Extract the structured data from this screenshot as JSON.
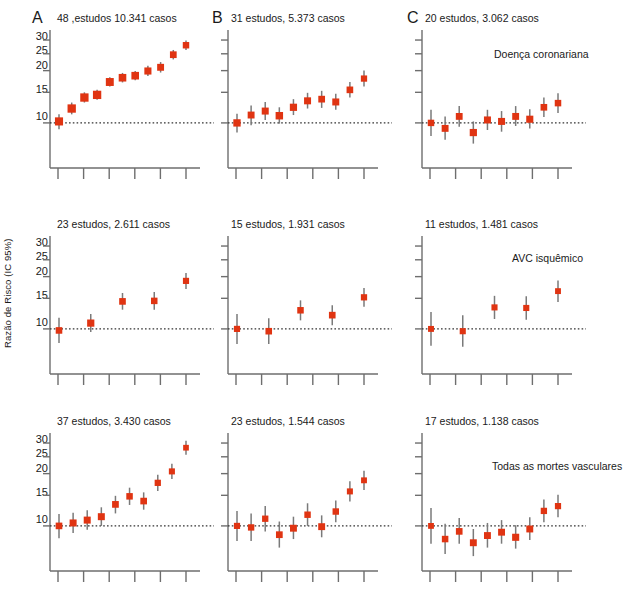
{
  "figure": {
    "axis_label_y": "Razão de Risco (IC 95%)",
    "marker_color": "#E03412",
    "whisker_color": "#7a7a7a",
    "axis_color": "#6e6e6e",
    "ref_line_color": "#333333",
    "ref_line_value": 1.0,
    "background": "#ffffff"
  },
  "panels": {
    "a1": {
      "letter": "A",
      "title": "48 ,estudos 10.341 casos",
      "note": ""
    },
    "b1": {
      "letter": "B",
      "title": "31 estudos, 5.373 casos",
      "note": ""
    },
    "c1": {
      "letter": "C",
      "title": "20 estudos, 3.062 casos",
      "note": "Doença coronariana"
    },
    "a2": {
      "letter": "",
      "title": "23 estudos, 2.611 casos",
      "note": ""
    },
    "b2": {
      "letter": "",
      "title": "15 estudos, 1.931 casos",
      "note": ""
    },
    "c2": {
      "letter": "",
      "title": "11 estudos, 1.481 casos",
      "note": "AVC isquêmico"
    },
    "a3": {
      "letter": "",
      "title": "37 estudos, 3.430 casos",
      "note": ""
    },
    "b3": {
      "letter": "",
      "title": "23 estudos, 1.544 casos",
      "note": ""
    },
    "c3": {
      "letter": "",
      "title": "17 estudos, 1.138 casos",
      "note": "Todas as mortes vasculares"
    }
  },
  "axis": {
    "y_ticks": [
      1.0,
      1.5,
      2.0,
      2.5,
      3.0
    ],
    "y_tick_labels": [
      "10",
      "15",
      "20",
      "25",
      "30"
    ],
    "y_min": 0.68,
    "y_max": 3.25,
    "x_tick_count": 6,
    "x_tick_labels": []
  },
  "chart_data": {
    "type": "scatter",
    "xlabel": "",
    "ylabel": "Razão de Risco (IC 95%)",
    "ylim": [
      0.68,
      3.25
    ],
    "yscale": "log",
    "ytick_values": [
      1.0,
      1.5,
      2.0,
      2.5,
      3.0
    ],
    "ytick_labels": [
      "10",
      "15",
      "20",
      "25",
      "30"
    ],
    "grid": false,
    "legend": "none",
    "reference_line": 1.0,
    "annotations": [
      "Doença coronariana",
      "AVC isquêmico",
      "Todas as mortes vasculares"
    ],
    "series": [
      {
        "name": "a1",
        "panel": "A",
        "row": "Doença coronariana",
        "studies": 48,
        "cases": "10.341",
        "label": "48 ,estudos 10.341 casos",
        "points": [
          {
            "x": 1,
            "y": 1.02,
            "lo": 0.92,
            "hi": 1.12
          },
          {
            "x": 2,
            "y": 1.21,
            "lo": 1.12,
            "hi": 1.31
          },
          {
            "x": 3,
            "y": 1.4,
            "lo": 1.31,
            "hi": 1.5
          },
          {
            "x": 4,
            "y": 1.45,
            "lo": 1.36,
            "hi": 1.55
          },
          {
            "x": 5,
            "y": 1.72,
            "lo": 1.62,
            "hi": 1.83
          },
          {
            "x": 6,
            "y": 1.82,
            "lo": 1.71,
            "hi": 1.94
          },
          {
            "x": 7,
            "y": 1.87,
            "lo": 1.76,
            "hi": 1.99
          },
          {
            "x": 8,
            "y": 1.99,
            "lo": 1.86,
            "hi": 2.13
          },
          {
            "x": 9,
            "y": 2.09,
            "lo": 1.95,
            "hi": 2.24
          },
          {
            "x": 10,
            "y": 2.47,
            "lo": 2.32,
            "hi": 2.63
          },
          {
            "x": 11,
            "y": 2.8,
            "lo": 2.63,
            "hi": 2.98
          }
        ]
      },
      {
        "name": "b1",
        "panel": "B",
        "row": "Doença coronariana",
        "studies": 31,
        "cases": "5.373",
        "label": "31 estudos, 5.373 casos",
        "points": [
          {
            "x": 1,
            "y": 1.0,
            "lo": 0.88,
            "hi": 1.13
          },
          {
            "x": 2,
            "y": 1.11,
            "lo": 0.97,
            "hi": 1.26
          },
          {
            "x": 3,
            "y": 1.17,
            "lo": 1.04,
            "hi": 1.32
          },
          {
            "x": 4,
            "y": 1.1,
            "lo": 0.99,
            "hi": 1.23
          },
          {
            "x": 5,
            "y": 1.23,
            "lo": 1.11,
            "hi": 1.37
          },
          {
            "x": 6,
            "y": 1.34,
            "lo": 1.21,
            "hi": 1.49
          },
          {
            "x": 7,
            "y": 1.37,
            "lo": 1.22,
            "hi": 1.53
          },
          {
            "x": 8,
            "y": 1.32,
            "lo": 1.19,
            "hi": 1.47
          },
          {
            "x": 9,
            "y": 1.55,
            "lo": 1.4,
            "hi": 1.72
          },
          {
            "x": 10,
            "y": 1.8,
            "lo": 1.62,
            "hi": 2.0
          }
        ]
      },
      {
        "name": "c1",
        "panel": "C",
        "row": "Doença coronariana",
        "studies": 20,
        "cases": "3.062",
        "label": "20 estudos, 3.062 casos",
        "points": [
          {
            "x": 1,
            "y": 1.0,
            "lo": 0.84,
            "hi": 1.19
          },
          {
            "x": 2,
            "y": 0.93,
            "lo": 0.8,
            "hi": 1.09
          },
          {
            "x": 3,
            "y": 1.09,
            "lo": 0.95,
            "hi": 1.25
          },
          {
            "x": 4,
            "y": 0.88,
            "lo": 0.76,
            "hi": 1.02
          },
          {
            "x": 5,
            "y": 1.04,
            "lo": 0.91,
            "hi": 1.19
          },
          {
            "x": 6,
            "y": 1.02,
            "lo": 0.89,
            "hi": 1.17
          },
          {
            "x": 7,
            "y": 1.09,
            "lo": 0.96,
            "hi": 1.25
          },
          {
            "x": 8,
            "y": 1.05,
            "lo": 0.93,
            "hi": 1.2
          },
          {
            "x": 9,
            "y": 1.23,
            "lo": 1.08,
            "hi": 1.4
          },
          {
            "x": 10,
            "y": 1.3,
            "lo": 1.14,
            "hi": 1.48
          }
        ]
      },
      {
        "name": "a2",
        "panel": "A",
        "row": "AVC isquêmico",
        "studies": 23,
        "cases": "2.611",
        "label": "23 estudos, 2.611 casos",
        "points": [
          {
            "x": 1,
            "y": 0.98,
            "lo": 0.83,
            "hi": 1.16
          },
          {
            "x": 2,
            "y": 1.08,
            "lo": 0.96,
            "hi": 1.22
          },
          {
            "x": 3,
            "y": 1.44,
            "lo": 1.29,
            "hi": 1.61
          },
          {
            "x": 4,
            "y": 1.45,
            "lo": 1.29,
            "hi": 1.63
          },
          {
            "x": 5,
            "y": 1.89,
            "lo": 1.7,
            "hi": 2.1
          }
        ]
      },
      {
        "name": "b2",
        "panel": "B",
        "row": "AVC isquêmico",
        "studies": 15,
        "cases": "1.931",
        "label": "15 estudos, 1.931 casos",
        "points": [
          {
            "x": 1,
            "y": 1.0,
            "lo": 0.82,
            "hi": 1.22
          },
          {
            "x": 2,
            "y": 0.97,
            "lo": 0.82,
            "hi": 1.15
          },
          {
            "x": 3,
            "y": 1.28,
            "lo": 1.12,
            "hi": 1.46
          },
          {
            "x": 4,
            "y": 1.2,
            "lo": 1.05,
            "hi": 1.37
          },
          {
            "x": 5,
            "y": 1.52,
            "lo": 1.34,
            "hi": 1.72
          }
        ]
      },
      {
        "name": "c2",
        "panel": "C",
        "row": "AVC isquêmico",
        "studies": 11,
        "cases": "1.481",
        "label": "11 estudos, 1.481 casos",
        "points": [
          {
            "x": 1,
            "y": 1.0,
            "lo": 0.8,
            "hi": 1.25
          },
          {
            "x": 2,
            "y": 0.97,
            "lo": 0.79,
            "hi": 1.2
          },
          {
            "x": 3,
            "y": 1.33,
            "lo": 1.14,
            "hi": 1.55
          },
          {
            "x": 4,
            "y": 1.32,
            "lo": 1.13,
            "hi": 1.54
          },
          {
            "x": 5,
            "y": 1.65,
            "lo": 1.43,
            "hi": 1.9
          }
        ]
      },
      {
        "name": "a3",
        "panel": "A",
        "row": "Todas as mortes vasculares",
        "studies": 37,
        "cases": "3.430",
        "label": "37 estudos, 3.430 casos",
        "points": [
          {
            "x": 1,
            "y": 1.0,
            "lo": 0.85,
            "hi": 1.17
          },
          {
            "x": 2,
            "y": 1.04,
            "lo": 0.91,
            "hi": 1.19
          },
          {
            "x": 3,
            "y": 1.08,
            "lo": 0.95,
            "hi": 1.23
          },
          {
            "x": 4,
            "y": 1.13,
            "lo": 1.0,
            "hi": 1.28
          },
          {
            "x": 5,
            "y": 1.33,
            "lo": 1.18,
            "hi": 1.49
          },
          {
            "x": 6,
            "y": 1.48,
            "lo": 1.32,
            "hi": 1.66
          },
          {
            "x": 7,
            "y": 1.39,
            "lo": 1.24,
            "hi": 1.56
          },
          {
            "x": 8,
            "y": 1.77,
            "lo": 1.59,
            "hi": 1.97
          },
          {
            "x": 9,
            "y": 2.06,
            "lo": 1.86,
            "hi": 2.28
          },
          {
            "x": 10,
            "y": 2.82,
            "lo": 2.57,
            "hi": 3.09
          }
        ]
      },
      {
        "name": "b3",
        "panel": "B",
        "row": "Todas as mortes vasculares",
        "studies": 23,
        "cases": "1.544",
        "label": "23 estudos, 1.544 casos",
        "points": [
          {
            "x": 1,
            "y": 1.0,
            "lo": 0.82,
            "hi": 1.22
          },
          {
            "x": 2,
            "y": 0.98,
            "lo": 0.82,
            "hi": 1.18
          },
          {
            "x": 3,
            "y": 1.1,
            "lo": 0.93,
            "hi": 1.3
          },
          {
            "x": 4,
            "y": 0.89,
            "lo": 0.75,
            "hi": 1.06
          },
          {
            "x": 5,
            "y": 0.97,
            "lo": 0.84,
            "hi": 1.13
          },
          {
            "x": 6,
            "y": 1.16,
            "lo": 1.0,
            "hi": 1.35
          },
          {
            "x": 7,
            "y": 0.99,
            "lo": 0.86,
            "hi": 1.15
          },
          {
            "x": 8,
            "y": 1.21,
            "lo": 1.05,
            "hi": 1.4
          },
          {
            "x": 9,
            "y": 1.58,
            "lo": 1.38,
            "hi": 1.81
          },
          {
            "x": 10,
            "y": 1.83,
            "lo": 1.61,
            "hi": 2.08
          }
        ]
      },
      {
        "name": "c3",
        "panel": "C",
        "row": "Todas as mortes vasculares",
        "studies": 17,
        "cases": "1.138",
        "label": "17 estudos, 1.138 casos",
        "points": [
          {
            "x": 1,
            "y": 1.0,
            "lo": 0.79,
            "hi": 1.27
          },
          {
            "x": 2,
            "y": 0.84,
            "lo": 0.69,
            "hi": 1.03
          },
          {
            "x": 3,
            "y": 0.93,
            "lo": 0.79,
            "hi": 1.11
          },
          {
            "x": 4,
            "y": 0.8,
            "lo": 0.67,
            "hi": 0.96
          },
          {
            "x": 5,
            "y": 0.88,
            "lo": 0.75,
            "hi": 1.04
          },
          {
            "x": 6,
            "y": 0.92,
            "lo": 0.79,
            "hi": 1.08
          },
          {
            "x": 7,
            "y": 0.86,
            "lo": 0.74,
            "hi": 1.01
          },
          {
            "x": 8,
            "y": 0.96,
            "lo": 0.83,
            "hi": 1.12
          },
          {
            "x": 9,
            "y": 1.22,
            "lo": 1.05,
            "hi": 1.42
          },
          {
            "x": 10,
            "y": 1.3,
            "lo": 1.12,
            "hi": 1.51
          }
        ]
      }
    ]
  }
}
